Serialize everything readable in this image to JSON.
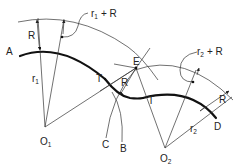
{
  "diagram": {
    "points": {
      "A": "A",
      "B": "B",
      "C": "C",
      "D": "D",
      "E": "E",
      "T1": "T",
      "T2": "T",
      "O1": "O",
      "O1_sub": "1",
      "O2": "O",
      "O2_sub": "2"
    },
    "labels": {
      "R_left": "R",
      "r1": "r",
      "r1_sub": "1",
      "r1_plus_R": "r",
      "r1_plus_R_sub": "1",
      "r1_plus_R_tail": "+ R",
      "R_middle": "R",
      "r2_plus_R": "r",
      "r2_plus_R_sub": "2",
      "r2_plus_R_tail": "+ R",
      "R_right": "R",
      "r2": "r",
      "r2_sub": "2"
    }
  }
}
